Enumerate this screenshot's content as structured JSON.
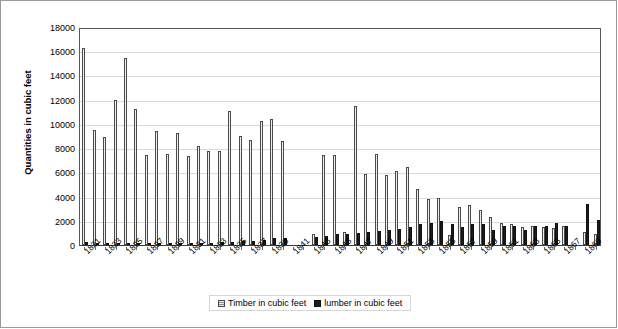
{
  "chart_data": {
    "type": "bar",
    "title": "",
    "xlabel": "",
    "ylabel": "Quantities in cubic feet",
    "ylim": [
      0,
      18000
    ],
    "ytick_step": 2000,
    "yticks": [
      "0",
      "2000",
      "4000",
      "6000",
      "8000",
      "10000",
      "12000",
      "14000",
      "16000",
      "18000"
    ],
    "grid": true,
    "legend_position": "bottom-center",
    "x_label_rotation": -45,
    "x_labels_every": 2,
    "categories": [
      "1821",
      "1822",
      "1823",
      "1824",
      "1825",
      "1826",
      "1827",
      "1828",
      "1829",
      "1830",
      "1831",
      "1832",
      "1833",
      "1834",
      "1835",
      "1836",
      "1837",
      "1838",
      "1839",
      "1840",
      "1841",
      "1842",
      "1843",
      "1844",
      "1845",
      "1846",
      "1847",
      "1848",
      "1849",
      "1850",
      "1851",
      "1852",
      "1853",
      "1854",
      "1855",
      "1856",
      "1857",
      "1858",
      "1859",
      "1860",
      "1861",
      "1862",
      "1863",
      "1864",
      "1865",
      "1866",
      "1867",
      "1868",
      "1869",
      "1870"
    ],
    "tick_labels": [
      "1821",
      "1823",
      "1825",
      "1827",
      "1829",
      "1831",
      "1833",
      "1835",
      "1837",
      "1839",
      "1841",
      "1843",
      "1845",
      "1847",
      "1849",
      "1851",
      "1853",
      "1855",
      "1857",
      "1859",
      "1861",
      "1863",
      "1865",
      "1867",
      "1869"
    ],
    "series": [
      {
        "name": "Timber in cubic feet",
        "color": "#8f8f8f",
        "pattern": "checkered",
        "values": [
          16300,
          9500,
          8950,
          11950,
          15450,
          11200,
          7400,
          9450,
          7550,
          9250,
          7350,
          8150,
          7800,
          7750,
          11050,
          9000,
          8650,
          10200,
          10400,
          8550,
          0,
          0,
          950,
          7450,
          7400,
          1050,
          11500,
          5900,
          7500,
          5800,
          6150,
          6450,
          4650,
          3800,
          3850,
          800,
          3150,
          3300,
          2900,
          2350,
          1800,
          1700,
          1500,
          1550,
          1500,
          1400,
          1550,
          0,
          1100,
          900
        ]
      },
      {
        "name": "lumber in cubic feet",
        "color": "#1c1c1c",
        "pattern": "solid",
        "values": [
          260,
          140,
          130,
          150,
          200,
          170,
          160,
          180,
          160,
          170,
          150,
          180,
          170,
          220,
          260,
          300,
          340,
          450,
          560,
          620,
          0,
          0,
          700,
          760,
          880,
          900,
          1000,
          1050,
          1150,
          1250,
          1350,
          1500,
          1700,
          1800,
          1950,
          1700,
          1500,
          1700,
          1750,
          1200,
          1600,
          1550,
          1250,
          1600,
          1600,
          1800,
          1600,
          0,
          3400,
          2050
        ]
      }
    ]
  },
  "legend": {
    "items": [
      {
        "label": "Timber in cubic feet",
        "swatch": "timber-swatch"
      },
      {
        "label": "lumber in cubic feet",
        "swatch": "lumber-swatch"
      }
    ]
  }
}
